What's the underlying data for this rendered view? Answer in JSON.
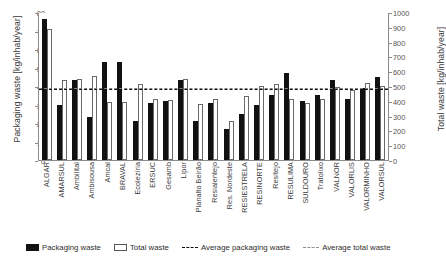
{
  "chart_data": {
    "type": "bar",
    "title": "",
    "xlabel": "",
    "ylabel": "Packaging waste  [kg/inhab/year]",
    "y2label": "Total waste  [kg/inhab/year]",
    "ylim": [
      0,
      80
    ],
    "y2lim": [
      0,
      1000
    ],
    "yticks": [
      80,
      70,
      60,
      50,
      40,
      30,
      20,
      10,
      0
    ],
    "y2ticks": [
      1000,
      900,
      800,
      700,
      600,
      500,
      400,
      300,
      200,
      100,
      0
    ],
    "grid": false,
    "legend_position": "bottom",
    "categories": [
      "ALGAR",
      "AMARSUL",
      "Ambilital",
      "Ambisousa",
      "Amcal",
      "BRAVAL",
      "Ecolezíria",
      "ERSUC",
      "Gesamb",
      "Lipor",
      "Planalto Beirão",
      "Resialentejo",
      "Res. Nordeste",
      "RESIESTRELA",
      "RESINORTE",
      "Resitejo",
      "RESULIMA",
      "SULDOURO",
      "Tratolixo",
      "VALNOR",
      "VALORLIS",
      "VALORMINHO",
      "VALORSUL"
    ],
    "series": [
      {
        "name": "Packaging waste",
        "axis": "left",
        "units": "kg/inhab/year",
        "color": "#111111",
        "values": [
          76,
          30,
          43,
          23,
          53,
          53,
          21,
          31,
          32,
          43,
          21,
          31,
          17,
          25,
          30,
          35,
          47,
          32,
          35,
          43,
          33,
          39,
          45
        ]
      },
      {
        "name": "Total waste",
        "axis": "right",
        "units": "kg/inhab/year",
        "color": "#ffffff",
        "values": [
          888,
          544,
          550,
          565,
          394,
          393,
          516,
          413,
          407,
          545,
          380,
          413,
          265,
          434,
          497,
          512,
          410,
          382,
          409,
          490,
          473,
          517,
          503
        ]
      }
    ],
    "reference_lines": [
      {
        "name": "Average packaging waste",
        "axis": "left",
        "value": 38,
        "style": "dashed",
        "color": "#111111"
      },
      {
        "name": "Average total waste",
        "axis": "right",
        "value": 480,
        "style": "dashed",
        "color": "#8e8e8e"
      }
    ],
    "legend": [
      "Packaging waste",
      "Total waste",
      "Average packaging waste",
      "Average total waste"
    ]
  }
}
